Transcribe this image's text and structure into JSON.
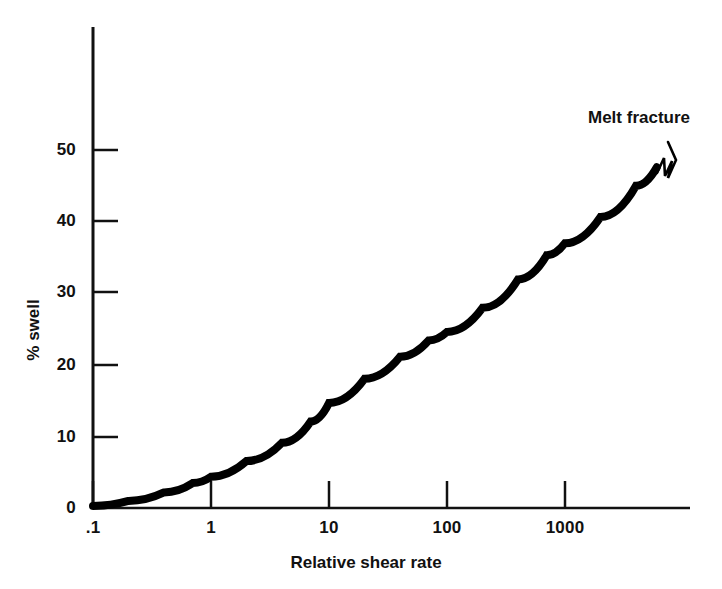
{
  "chart_data": {
    "type": "line",
    "title": "",
    "xlabel": "Relative shear rate",
    "ylabel": "% swell",
    "xscale": "log",
    "yscale": "linear",
    "xlim": [
      0.1,
      10000
    ],
    "ylim": [
      0,
      60
    ],
    "xticks": [
      0.1,
      1,
      10,
      100,
      1000
    ],
    "xtick_labels": [
      ".1",
      "1",
      "10",
      "100",
      "1000"
    ],
    "yticks": [
      0,
      10,
      20,
      30,
      40,
      50
    ],
    "ytick_labels": [
      "0",
      "10",
      "20",
      "30",
      "40",
      "50"
    ],
    "grid": false,
    "legend": false,
    "series": [
      {
        "name": "Extrudate swell",
        "color": "#000000",
        "x": [
          0.1,
          0.2,
          0.4,
          0.7,
          1,
          2,
          4,
          7,
          10,
          20,
          40,
          70,
          100,
          200,
          400,
          700,
          1000,
          2000,
          4000,
          6000
        ],
        "values": [
          0.3,
          1.0,
          2.2,
          3.5,
          4.4,
          6.6,
          9.2,
          12.2,
          14.8,
          18.2,
          21.3,
          23.6,
          24.8,
          28.2,
          32.2,
          35.6,
          37.3,
          41.0,
          45.4,
          48.0
        ]
      }
    ],
    "annotations": [
      {
        "name": "melt-fracture",
        "text": "Melt fracture",
        "x": 6000,
        "y": 48,
        "marker": "zigzag"
      }
    ]
  },
  "axes": {
    "x_title": "Relative shear rate",
    "y_title": "% swell",
    "x_tick_labels": [
      ".1",
      "1",
      "10",
      "100",
      "1000"
    ],
    "y_tick_labels": [
      "0",
      "10",
      "20",
      "30",
      "40",
      "50"
    ]
  },
  "annotation": {
    "melt_fracture_label": "Melt fracture"
  },
  "colors": {
    "curve": "#000000",
    "axis": "#111111",
    "background": "#ffffff"
  }
}
